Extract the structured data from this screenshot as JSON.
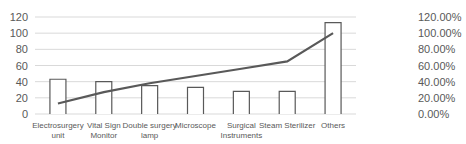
{
  "chart_data": {
    "type": "bar",
    "title": "",
    "xlabel": "",
    "ylabel": "",
    "categories": [
      "Electrosurgery unit",
      "Vital Sign Monitor",
      "Double surgery lamp",
      "Microscope",
      "Surgical Instruments",
      "Steam Sterilizer",
      "Others"
    ],
    "category_lines": [
      [
        "Electrosurgery",
        "unit"
      ],
      [
        "Vital Sign",
        "Monitor"
      ],
      [
        "Double surgery",
        "lamp"
      ],
      [
        "Microscope"
      ],
      [
        "Surgical",
        "Instruments"
      ],
      [
        "Steam Sterilizer"
      ],
      [
        "Others"
      ]
    ],
    "series": [
      {
        "name": "Count",
        "type": "bar",
        "axis": "left",
        "values": [
          43,
          40,
          35,
          33,
          28,
          28,
          113
        ]
      },
      {
        "name": "Cumulative %",
        "type": "line",
        "axis": "right",
        "values": [
          13,
          27,
          38,
          47,
          56,
          65,
          100
        ]
      }
    ],
    "ylim": [
      0,
      120
    ],
    "y_ticks": [
      "0",
      "20",
      "40",
      "60",
      "80",
      "100",
      "120"
    ],
    "y2lim": [
      0,
      120
    ],
    "y2_ticks": [
      "0.00%",
      "20.00%",
      "40.00%",
      "60.00%",
      "80.00%",
      "100.00%",
      "120.00%"
    ],
    "grid": true,
    "legend": "none",
    "colors": {
      "bar_stroke": "#595959",
      "line": "#595959",
      "grid": "#d9d9d9",
      "text": "#595959"
    }
  }
}
